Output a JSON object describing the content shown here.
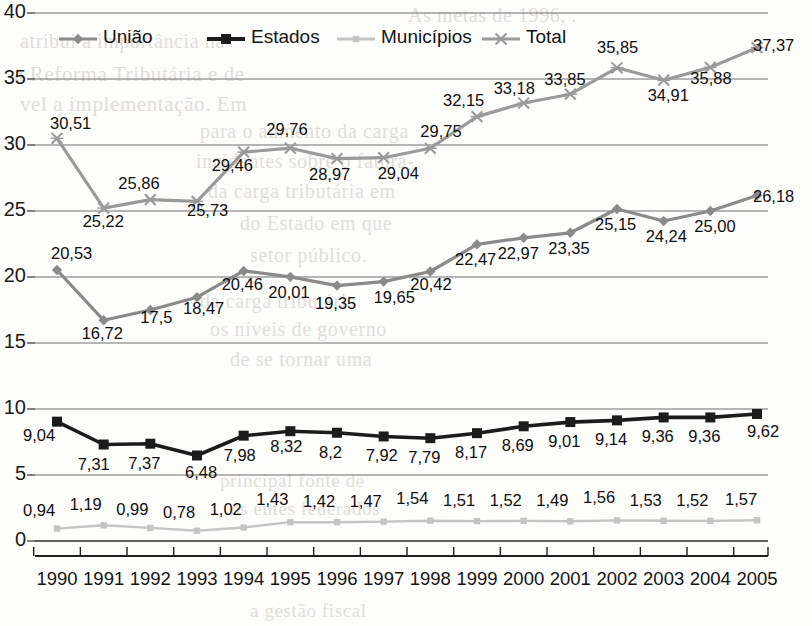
{
  "chart_data": {
    "type": "line",
    "title": "",
    "xlabel": "",
    "ylabel": "",
    "ylim": [
      0,
      40
    ],
    "yticks": [
      0,
      5,
      10,
      15,
      20,
      25,
      30,
      35,
      40
    ],
    "grid": true,
    "legend_position": "top",
    "categories": [
      "1990",
      "1991",
      "1992",
      "1993",
      "1994",
      "1995",
      "1996",
      "1997",
      "1998",
      "1999",
      "2000",
      "2001",
      "2002",
      "2003",
      "2004",
      "2005"
    ],
    "series": [
      {
        "name": "União",
        "color": "#8a8a8a",
        "marker": "diamond",
        "values": [
          20.53,
          16.72,
          17.5,
          18.47,
          20.46,
          20.01,
          19.35,
          19.65,
          20.42,
          22.47,
          22.97,
          23.35,
          25.15,
          24.24,
          25.0,
          26.18
        ],
        "labels": [
          "20,53",
          "16,72",
          "17,5",
          "18,47",
          "20,46",
          "20,01",
          "19,35",
          "19,65",
          "20,42",
          "22,47",
          "22,97",
          "23,35",
          "25,15",
          "24,24",
          "25,00",
          "26,18"
        ]
      },
      {
        "name": "Estados",
        "color": "#1c1c1c",
        "marker": "square",
        "values": [
          9.04,
          7.31,
          7.37,
          6.48,
          7.98,
          8.32,
          8.2,
          7.92,
          7.79,
          8.17,
          8.69,
          9.01,
          9.14,
          9.36,
          9.36,
          9.62
        ],
        "labels": [
          "9,04",
          "7,31",
          "7,37",
          "6,48",
          "7,98",
          "8,32",
          "8,2",
          "7,92",
          "7,79",
          "8,17",
          "8,69",
          "9,01",
          "9,14",
          "9,36",
          "9,36",
          "9,62"
        ]
      },
      {
        "name": "Municípios",
        "color": "#c4c4c4",
        "marker": "small-square",
        "values": [
          0.94,
          1.19,
          0.99,
          0.78,
          1.02,
          1.43,
          1.42,
          1.47,
          1.54,
          1.51,
          1.52,
          1.49,
          1.56,
          1.53,
          1.52,
          1.57
        ],
        "labels": [
          "0,94",
          "1,19",
          "0,99",
          "0,78",
          "1,02",
          "1,43",
          "1,42",
          "1,47",
          "1,54",
          "1,51",
          "1,52",
          "1,49",
          "1,56",
          "1,53",
          "1,52",
          "1,57"
        ]
      },
      {
        "name": "Total",
        "color": "#9a9a9a",
        "marker": "cross",
        "values": [
          30.51,
          25.22,
          25.86,
          25.73,
          29.46,
          29.76,
          28.97,
          29.04,
          29.75,
          32.15,
          33.18,
          33.85,
          35.85,
          34.91,
          35.88,
          37.37
        ],
        "labels": [
          "30,51",
          "25,22",
          "25,86",
          "25,73",
          "29,46",
          "29,76",
          "28,97",
          "29,04",
          "29,75",
          "32,15",
          "33,18",
          "33,85",
          "35,85",
          "34,91",
          "35,88",
          "37,37"
        ]
      }
    ]
  },
  "legend": {
    "items": [
      {
        "label": "União",
        "color": "#8a8a8a",
        "marker": "diamond",
        "x": 57,
        "y": 27
      },
      {
        "label": "Estados",
        "color": "#1c1c1c",
        "marker": "square",
        "x": 205,
        "y": 27
      },
      {
        "label": "Municípios",
        "color": "#c4c4c4",
        "marker": "small-square",
        "x": 335,
        "y": 27
      },
      {
        "label": "Total",
        "color": "#9a9a9a",
        "marker": "cross",
        "x": 480,
        "y": 27
      }
    ]
  },
  "background_text": [
    {
      "text": "As metas de 1996, .",
      "x": 408,
      "y": 4,
      "size": 20
    },
    {
      "text": "atribui a importância na",
      "x": 20,
      "y": 30,
      "size": 20
    },
    {
      "text": "a Reforma Tributária e de",
      "x": 14,
      "y": 62,
      "size": 21
    },
    {
      "text": "vel a implementação. Em",
      "x": 20,
      "y": 92,
      "size": 21
    },
    {
      "text": "para o aumento da carga",
      "x": 200,
      "y": 120,
      "size": 20
    },
    {
      "text": "incidentes sobre o fatura-",
      "x": 196,
      "y": 150,
      "size": 20
    },
    {
      "text": "da carga tributária em",
      "x": 208,
      "y": 180,
      "size": 20
    },
    {
      "text": "do Estado em que",
      "x": 240,
      "y": 212,
      "size": 20
    },
    {
      "text": "setor público.",
      "x": 250,
      "y": 244,
      "size": 20
    },
    {
      "text": "da carga tributária",
      "x": 200,
      "y": 290,
      "size": 20
    },
    {
      "text": "os níveis de governo",
      "x": 210,
      "y": 318,
      "size": 20
    },
    {
      "text": "de se tornar uma",
      "x": 230,
      "y": 348,
      "size": 20
    },
    {
      "text": "principal fonte de",
      "x": 220,
      "y": 470,
      "size": 19
    },
    {
      "text": "os entes federados",
      "x": 230,
      "y": 498,
      "size": 19
    },
    {
      "text": "a gestão fiscal",
      "x": 250,
      "y": 600,
      "size": 19
    }
  ]
}
